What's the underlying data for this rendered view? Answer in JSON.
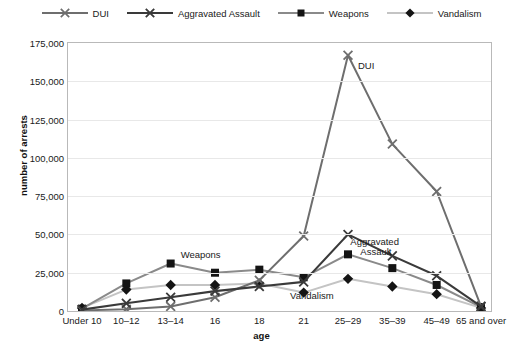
{
  "chart_data": {
    "type": "line",
    "title": "",
    "xlabel": "age",
    "ylabel": "number of arrests",
    "categories": [
      "Under 10",
      "10–12",
      "13–14",
      "16",
      "18",
      "21",
      "25–29",
      "35–39",
      "45–49",
      "65 and over"
    ],
    "ylim": [
      0,
      175000
    ],
    "ytick_values": [
      0,
      25000,
      50000,
      75000,
      100000,
      125000,
      150000,
      175000
    ],
    "ytick_labels": [
      "0",
      "25,000",
      "50,000",
      "75,000",
      "100,000",
      "125,000",
      "150,000",
      "175,000"
    ],
    "grid": true,
    "legend_position": "top",
    "series": [
      {
        "name": "DUI",
        "color": "#6e6e6e",
        "marker": "x",
        "values": [
          400,
          1200,
          3000,
          9000,
          20000,
          49000,
          167000,
          109000,
          78000,
          3000
        ]
      },
      {
        "name": "Aggravated Assault",
        "color": "#3a3a3a",
        "marker": "x",
        "values": [
          900,
          5000,
          9000,
          13000,
          16000,
          19000,
          50000,
          36000,
          23000,
          3000
        ]
      },
      {
        "name": "Weapons",
        "color": "#8a8a8a",
        "marker": "square",
        "values": [
          1500,
          18000,
          31000,
          25000,
          27000,
          22000,
          37000,
          28000,
          17000,
          2500
        ]
      },
      {
        "name": "Vandalism",
        "color": "#c4c4c4",
        "marker": "diamond",
        "values": [
          2000,
          14000,
          17000,
          17000,
          18000,
          12000,
          21000,
          16000,
          11000,
          2000
        ]
      }
    ],
    "annotations": [
      {
        "text": "DUI",
        "series": "DUI"
      },
      {
        "text": "Aggravated",
        "series": "Aggravated Assault"
      },
      {
        "text": "Assault",
        "series": "Aggravated Assault"
      },
      {
        "text": "Weapons",
        "series": "Weapons"
      },
      {
        "text": "Vandalism",
        "series": "Vandalism"
      }
    ]
  },
  "legend": {
    "items": [
      {
        "label": "DUI",
        "marker": "x-marker",
        "color": "#6e6e6e"
      },
      {
        "label": "Aggravated Assault",
        "marker": "x-marker",
        "color": "#3a3a3a"
      },
      {
        "label": "Weapons",
        "marker": "square-marker",
        "color": "#8a8a8a"
      },
      {
        "label": "Vandalism",
        "marker": "diamond-marker",
        "color": "#c4c4c4"
      }
    ]
  },
  "axes": {
    "x_title": "age",
    "y_title": "number of arrests"
  },
  "caption": ""
}
